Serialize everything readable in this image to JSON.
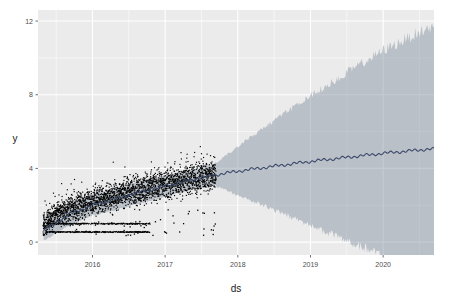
{
  "chart_data": {
    "type": "line",
    "title": "",
    "subtitle": "",
    "xlabel": "ds",
    "ylabel": "y",
    "grid": true,
    "legend": null,
    "xlim": [
      2015.25,
      2020.7
    ],
    "ylim": [
      -0.7,
      12.6
    ],
    "xticks": [
      2016,
      2017,
      2018,
      2019,
      2020
    ],
    "xtick_labels": [
      "2016",
      "2017",
      "2018",
      "2019",
      "2020"
    ],
    "yticks": [
      0,
      4,
      8,
      12
    ],
    "ytick_labels": [
      "0",
      "4",
      "8",
      "12"
    ],
    "panel_background": "#EBEBEB",
    "grid_color": "#FFFFFF",
    "history_end_x": 2017.7,
    "history_start_x": 2015.32,
    "series": [
      {
        "name": "observed",
        "type": "scatter",
        "color": "#000000",
        "marker_size": 1.2,
        "x": [
          2015.32,
          2015.37,
          2015.42,
          2015.47,
          2015.52,
          2015.57,
          2015.62,
          2015.67,
          2015.72,
          2015.77,
          2015.82,
          2015.87,
          2015.92,
          2015.97,
          2016.02,
          2016.07,
          2016.12,
          2016.17,
          2016.22,
          2016.27,
          2016.32,
          2016.37,
          2016.42,
          2016.47,
          2016.52,
          2016.57,
          2016.62,
          2016.67,
          2016.72,
          2016.77,
          2016.82,
          2016.87,
          2016.92,
          2016.97,
          2017.02,
          2017.07,
          2017.12,
          2017.17,
          2017.22,
          2017.27,
          2017.32,
          2017.37,
          2017.42,
          2017.47,
          2017.52,
          2017.57,
          2017.62,
          2017.67
        ],
        "y": [
          0.8,
          1.05,
          1.25,
          1.4,
          1.55,
          1.62,
          1.7,
          1.78,
          1.85,
          1.92,
          1.98,
          2.05,
          2.1,
          2.16,
          2.22,
          2.28,
          2.33,
          2.38,
          2.44,
          2.49,
          2.54,
          2.59,
          2.64,
          2.69,
          2.73,
          2.78,
          2.82,
          2.86,
          2.9,
          2.94,
          2.98,
          3.02,
          3.06,
          3.1,
          3.14,
          3.18,
          3.22,
          3.25,
          3.29,
          3.32,
          3.36,
          3.39,
          3.43,
          3.46,
          3.5,
          3.53,
          3.56,
          3.6
        ]
      },
      {
        "name": "yhat",
        "type": "line",
        "color": "#3b4a6b",
        "linewidth": 1.1,
        "x": [
          2015.32,
          2015.7,
          2016.0,
          2016.5,
          2017.0,
          2017.5,
          2017.7,
          2018.0,
          2018.5,
          2019.0,
          2019.5,
          2020.0,
          2020.5,
          2020.62
        ],
        "y": [
          0.6,
          1.55,
          2.0,
          2.55,
          3.05,
          3.5,
          3.65,
          3.85,
          4.12,
          4.38,
          4.6,
          4.82,
          5.0,
          5.05
        ]
      }
    ],
    "uncertainty_band": {
      "name": "yhat_lower / yhat_upper",
      "color": "#7f8c9b",
      "opacity": 0.45,
      "x": [
        2015.32,
        2015.7,
        2016.0,
        2016.5,
        2017.0,
        2017.5,
        2017.7,
        2018.0,
        2018.5,
        2019.0,
        2019.5,
        2020.0,
        2020.5,
        2020.62
      ],
      "upper": [
        1.35,
        2.2,
        2.6,
        3.15,
        3.62,
        4.05,
        4.3,
        5.2,
        6.6,
        7.95,
        9.2,
        10.4,
        11.4,
        11.6
      ],
      "lower": [
        0.05,
        0.95,
        1.45,
        1.95,
        2.48,
        2.95,
        3.05,
        2.55,
        1.75,
        0.9,
        0.05,
        -0.75,
        -1.5,
        -1.7
      ]
    },
    "outlier_rows": [
      {
        "y": 1.0,
        "note": "dense horizontal run of observations near y=1"
      },
      {
        "y": 0.55,
        "note": "dense horizontal run of observations near y=0.5"
      }
    ]
  }
}
